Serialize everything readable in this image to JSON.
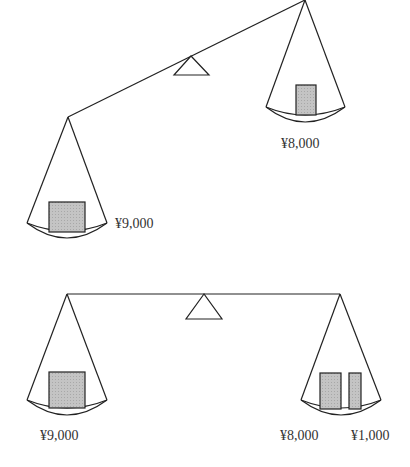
{
  "diagram": {
    "colors": {
      "line": "#222222",
      "box_fill": "#bdbdbd",
      "text": "#333333"
    },
    "scales": [
      {
        "state": "tilted",
        "left_pan": {
          "items": [
            {
              "label": "¥9,000"
            }
          ]
        },
        "right_pan": {
          "items": [
            {
              "label": "¥8,000"
            }
          ]
        }
      },
      {
        "state": "balanced",
        "left_pan": {
          "items": [
            {
              "label": "¥9,000"
            }
          ]
        },
        "right_pan": {
          "items": [
            {
              "label": "¥8,000"
            },
            {
              "label": "¥1,000"
            }
          ]
        }
      }
    ]
  }
}
